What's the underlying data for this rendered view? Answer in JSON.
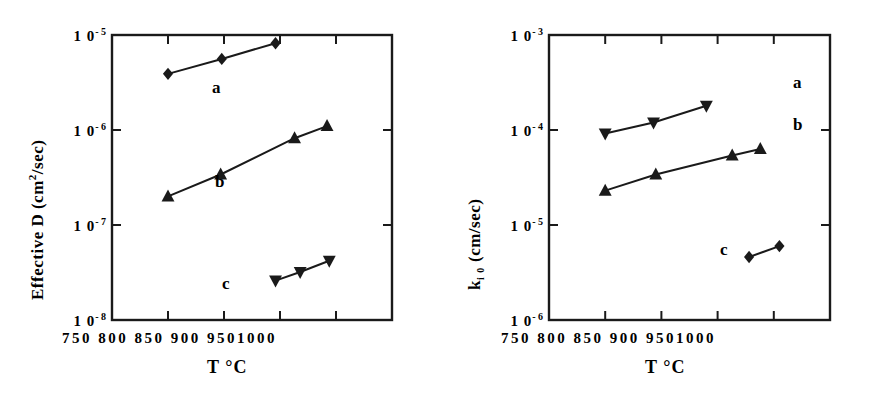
{
  "figure": {
    "background": "#ffffff",
    "ink_color": "#1a1a1a",
    "panel_count": 2
  },
  "left_panel": {
    "ylabel_text": "Effective  D  (cm",
    "ylabel_sup": "2",
    "ylabel_tail": "/sec)",
    "xlabel": "T °C",
    "ytick_labels": [
      "1 0",
      "1 0",
      "1 0",
      "1 0"
    ],
    "ytick_exponents": [
      "- 5",
      "- 6",
      "- 7",
      "- 8"
    ],
    "xtick_row": "750  800  850  900  9501000",
    "series_labels": [
      "a",
      "b",
      "c"
    ]
  },
  "right_panel": {
    "ylabel_head": "k",
    "ylabel_sub": "i 0",
    "ylabel_tail": "  (cm/sec)",
    "xlabel": "T °C",
    "ytick_labels": [
      "1 0",
      "1 0",
      "1 0",
      "1 0"
    ],
    "ytick_exponents": [
      "- 3",
      "- 4",
      "- 5",
      "- 6"
    ],
    "xtick_row": "750  800  850  900  9501000",
    "series_labels": [
      "a",
      "b",
      "c"
    ]
  },
  "chart_data": [
    {
      "type": "scatter",
      "panel": "left",
      "title": "",
      "xlabel": "T °C",
      "ylabel": "Effective D (cm2/sec)",
      "xlim": [
        750,
        1000
      ],
      "ylim": [
        1e-08,
        1e-05
      ],
      "yscale": "log",
      "xticks": [
        750,
        800,
        850,
        900,
        950,
        1000
      ],
      "yticks": [
        1e-08,
        1e-07,
        1e-06,
        1e-05
      ],
      "ytick_labels": [
        "10-8",
        "10-7",
        "10-6",
        "10-5"
      ],
      "grid": false,
      "legend": "inline-annotations",
      "series": [
        {
          "name": "a",
          "marker": "diamond",
          "line": true,
          "x": [
            800,
            848,
            896
          ],
          "y": [
            3.9e-06,
            5.6e-06,
            8.2e-06
          ],
          "label_position": {
            "x": 870,
            "y": 2.3e-06
          }
        },
        {
          "name": "b",
          "marker": "triangle-up",
          "line": true,
          "x": [
            800,
            847,
            913,
            942
          ],
          "y": [
            2e-07,
            3.4e-07,
            8.2e-07,
            1.1e-06
          ],
          "label_position": {
            "x": 872,
            "y": 2.1e-07
          }
        },
        {
          "name": "c",
          "marker": "triangle-down",
          "line": true,
          "x": [
            896,
            918,
            944
          ],
          "y": [
            2.6e-08,
            3.2e-08,
            4.2e-08
          ],
          "label_position": {
            "x": 876,
            "y": 2e-08
          }
        }
      ]
    },
    {
      "type": "scatter",
      "panel": "right",
      "title": "",
      "xlabel": "T °C",
      "ylabel": "k_i0 (cm/sec)",
      "xlim": [
        750,
        1000
      ],
      "ylim": [
        1e-06,
        0.001
      ],
      "yscale": "log",
      "xticks": [
        750,
        800,
        850,
        900,
        950,
        1000
      ],
      "yticks": [
        1e-06,
        1e-05,
        0.0001,
        0.001
      ],
      "ytick_labels": [
        "10-6",
        "10-5",
        "10-4",
        "10-3"
      ],
      "grid": false,
      "legend": "inline-annotations",
      "series": [
        {
          "name": "a",
          "marker": "triangle-down",
          "line": true,
          "x": [
            800,
            843,
            890
          ],
          "y": [
            9.2e-05,
            0.00012,
            0.00018
          ],
          "label_position": {
            "x": 975,
            "y": 0.00023
          }
        },
        {
          "name": "b",
          "marker": "triangle-up",
          "line": true,
          "x": [
            800,
            845,
            913,
            938
          ],
          "y": [
            2.3e-05,
            3.4e-05,
            5.4e-05,
            6.3e-05
          ],
          "label_position": {
            "x": 975,
            "y": 9.5e-05
          }
        },
        {
          "name": "c",
          "marker": "diamond",
          "line": true,
          "x": [
            928,
            955
          ],
          "y": [
            4.6e-06,
            6e-06
          ],
          "label_position": {
            "x": 903,
            "y": 4.3e-06
          }
        }
      ]
    }
  ]
}
